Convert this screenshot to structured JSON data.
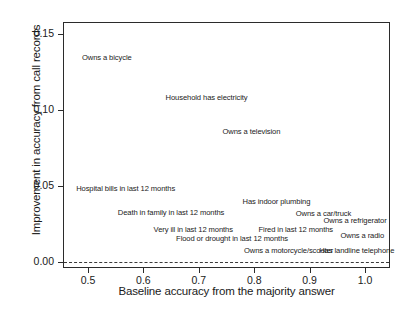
{
  "chart_data": {
    "type": "scatter",
    "title": "",
    "xlabel": "Baseline accuracy from the majority answer",
    "ylabel": "Improvement in accuracy from call records",
    "xlim": [
      0.455,
      1.045
    ],
    "ylim": [
      -0.004,
      0.158
    ],
    "xticks": [
      0.5,
      0.6,
      0.7,
      0.8,
      0.9,
      1.0
    ],
    "xtick_labels": [
      "0.5",
      "0.6",
      "0.7",
      "0.8",
      "0.9",
      "1.0"
    ],
    "yticks": [
      0.0,
      0.05,
      0.1,
      0.15
    ],
    "ytick_labels": [
      "0.00",
      "0.05",
      "0.10",
      "0.15"
    ],
    "grid": false,
    "legend": null,
    "marker_style": "text-label-only",
    "reference_lines": [
      {
        "name": "zero-line",
        "axis": "y",
        "value": 0.0,
        "style": "dashed"
      }
    ],
    "points": [
      {
        "label": "Owns a bicycle",
        "x": 0.534,
        "y": 0.1345
      },
      {
        "label": "Household has electricity",
        "x": 0.714,
        "y": 0.1082
      },
      {
        "label": "Owns a television",
        "x": 0.795,
        "y": 0.0855
      },
      {
        "label": "Hospital bills in last 12 months",
        "x": 0.568,
        "y": 0.0482
      },
      {
        "label": "Has indoor plumbing",
        "x": 0.84,
        "y": 0.0392
      },
      {
        "label": "Death in family in last 12 months",
        "x": 0.65,
        "y": 0.0322
      },
      {
        "label": "Owns a car/truck",
        "x": 0.925,
        "y": 0.0315
      },
      {
        "label": "Owns a refrigerator",
        "x": 0.982,
        "y": 0.0272
      },
      {
        "label": "Very ill in last 12 months",
        "x": 0.69,
        "y": 0.0212
      },
      {
        "label": "Fired in last 12 months",
        "x": 0.875,
        "y": 0.0212
      },
      {
        "label": "Owns a radio",
        "x": 0.995,
        "y": 0.0168
      },
      {
        "label": "Flood or drought in last 12 months",
        "x": 0.76,
        "y": 0.0148
      },
      {
        "label": "Owns a motorcycle/scooter",
        "x": 0.862,
        "y": 0.0072
      },
      {
        "label": "Has landline telephone",
        "x": 0.985,
        "y": 0.0072
      }
    ]
  }
}
